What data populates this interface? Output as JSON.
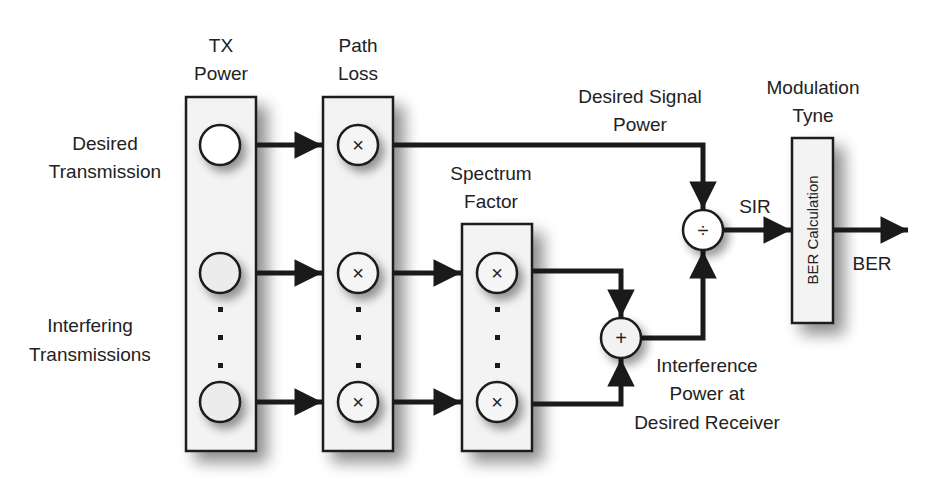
{
  "diagram": {
    "type": "block-diagram",
    "stages": {
      "tx_power": {
        "title_line1": "TX",
        "title_line2": "Power"
      },
      "path_loss": {
        "title_line1": "Path",
        "title_line2": "Loss"
      },
      "spectrum_factor": {
        "title_line1": "Spectrum",
        "title_line2": "Factor"
      },
      "modulation": {
        "title_line1": "Modulation",
        "title_line2": "Tyne",
        "block_label": "BER Calculation"
      }
    },
    "inputs": {
      "desired": {
        "line1": "Desired",
        "line2": "Transmission"
      },
      "interfering": {
        "line1": "Interfering",
        "line2": "Transmissions"
      }
    },
    "signals": {
      "desired_signal_power": {
        "line1": "Desired Signal",
        "line2": "Power"
      },
      "interference_power": {
        "line1": "Interference",
        "line2": "Power at",
        "line3": "Desired Receiver"
      },
      "sir": "SIR",
      "ber": "BER"
    },
    "operators": {
      "multiply": "×",
      "add": "+",
      "divide": "÷"
    },
    "colors": {
      "line": "#1a1a1a",
      "box_fill": "#f3f3f3",
      "shadow": "#9a9a9a"
    }
  }
}
